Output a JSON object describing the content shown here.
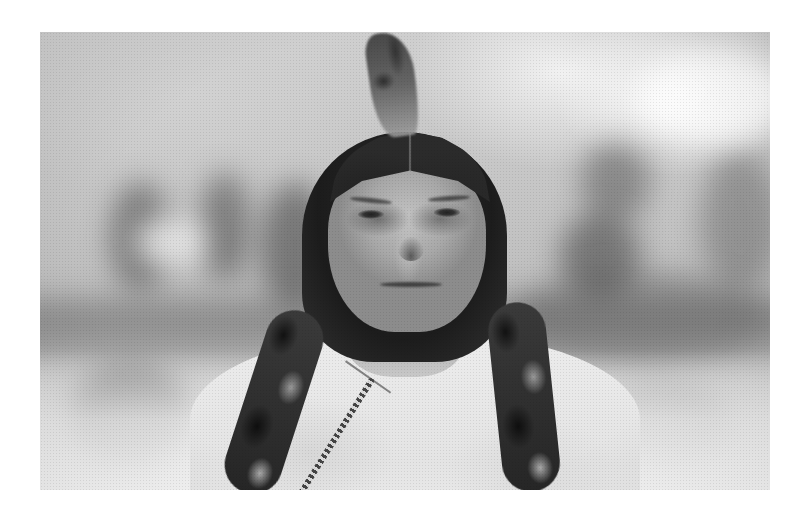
{
  "image": {
    "alt": "Black-and-white historical portrait of a man with long dark hair parted in the middle, a single feather on top of his head, fur-wrapped braids, a light shirt and a beaded necklace, in front of a blurred outdoor background with trees",
    "type": "photograph",
    "tone": "grayscale",
    "frame": {
      "left": 40,
      "top": 32,
      "width": 730,
      "height": 458
    }
  },
  "palette": {
    "page_background": "#ffffff",
    "photo_midtone": "#c9c9c9",
    "hair": "#1c1c1c",
    "face": "#a8a8a8",
    "shirt": "#e8e8e8"
  },
  "background_blobs": [
    {
      "x": 70,
      "y": 150,
      "w": 60,
      "h": 110,
      "color": "rgba(70,70,70,0.55)"
    },
    {
      "x": 160,
      "y": 140,
      "w": 50,
      "h": 110,
      "color": "rgba(60,60,60,0.5)"
    },
    {
      "x": 95,
      "y": 185,
      "w": 70,
      "h": 50,
      "color": "rgba(240,240,240,0.8)"
    },
    {
      "x": 220,
      "y": 150,
      "w": 70,
      "h": 130,
      "color": "rgba(60,60,60,0.55)"
    },
    {
      "x": 540,
      "y": 110,
      "w": 70,
      "h": 80,
      "color": "rgba(80,80,80,0.5)"
    },
    {
      "x": 520,
      "y": 180,
      "w": 80,
      "h": 90,
      "color": "rgba(60,60,60,0.55)"
    },
    {
      "x": 660,
      "y": 120,
      "w": 80,
      "h": 140,
      "color": "rgba(90,90,90,0.45)"
    },
    {
      "x": 470,
      "y": 240,
      "w": 260,
      "h": 90,
      "color": "rgba(90,90,90,0.45)"
    },
    {
      "x": 30,
      "y": 330,
      "w": 120,
      "h": 110,
      "color": "rgba(80,80,80,0.5)"
    },
    {
      "x": 560,
      "y": 350,
      "w": 130,
      "h": 90,
      "color": "rgba(110,110,110,0.35)"
    },
    {
      "x": 600,
      "y": 20,
      "w": 150,
      "h": 90,
      "color": "rgba(255,255,255,0.85)"
    }
  ],
  "figure": {
    "braids": [
      {
        "side": "left",
        "x": 205,
        "y": 275,
        "h": 190,
        "rotate": 18
      },
      {
        "side": "right",
        "x": 455,
        "y": 270,
        "h": 190,
        "rotate": -6
      }
    ],
    "eyes": [
      {
        "x": 318,
        "y": 178
      },
      {
        "x": 394,
        "y": 176
      }
    ],
    "brows": [
      {
        "x": 310,
        "y": 166,
        "w": 42,
        "rotate": 6
      },
      {
        "x": 388,
        "y": 164,
        "w": 42,
        "rotate": -4
      }
    ]
  }
}
